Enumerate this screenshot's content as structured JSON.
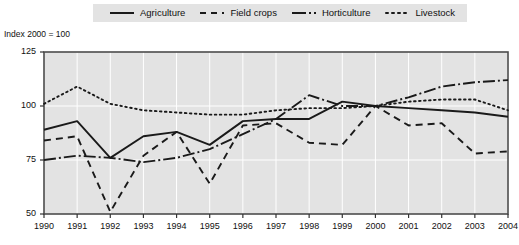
{
  "axis_note": "Index 2000 = 100",
  "legend": {
    "items": [
      {
        "label": "Agriculture",
        "key": "solid-line-key",
        "style": "solid"
      },
      {
        "label": "Field crops",
        "key": "dashed-line-key",
        "style": "dashed"
      },
      {
        "label": "Horticulture",
        "key": "dash-dot-line-key",
        "style": "dashdot"
      },
      {
        "label": "Livestock",
        "key": "dotted-line-key",
        "style": "dotted"
      }
    ]
  },
  "colors": {
    "line": "#1a1a1a",
    "plot_background": "#e3e3e3",
    "gridline": "#ffffff",
    "frame": "#4d4d4d",
    "legend_background": "#e3e3e3",
    "page_background": "#ffffff"
  },
  "chart_data": {
    "type": "line",
    "title": "",
    "subtitle": "",
    "xlabel": "",
    "ylabel": "Index 2000 = 100",
    "x": [
      1990,
      1991,
      1992,
      1993,
      1994,
      1995,
      1996,
      1997,
      1998,
      1999,
      2000,
      2001,
      2002,
      2003,
      2004
    ],
    "categories": [
      "1990",
      "1991",
      "1992",
      "1993",
      "1994",
      "1995",
      "1996",
      "1997",
      "1998",
      "1999",
      "2000",
      "2001",
      "2002",
      "2003",
      "2004"
    ],
    "xlim": [
      1990,
      2004
    ],
    "ylim": [
      50,
      125
    ],
    "yticks": [
      50,
      75,
      100,
      125
    ],
    "xticks": [
      "1990",
      "1991",
      "1992",
      "1993",
      "1994",
      "1995",
      "1996",
      "1997",
      "1998",
      "1999",
      "2000",
      "2001",
      "2002",
      "2003",
      "2004"
    ],
    "grid": true,
    "legend_position": "top",
    "series": [
      {
        "name": "Agriculture",
        "style": "solid",
        "values": [
          89,
          93,
          76,
          86,
          88,
          82,
          93,
          94,
          94,
          102,
          100,
          99,
          98,
          97,
          95
        ]
      },
      {
        "name": "Field crops",
        "style": "dashed",
        "values": [
          84,
          86,
          51,
          77,
          88,
          64,
          91,
          92,
          83,
          82,
          100,
          91,
          92,
          78,
          79
        ]
      },
      {
        "name": "Horticulture",
        "style": "dashdot",
        "values": [
          75,
          77,
          76,
          74,
          76,
          80,
          87,
          94,
          105,
          100,
          100,
          104,
          109,
          111,
          112
        ]
      },
      {
        "name": "Livestock",
        "style": "dotted",
        "values": [
          101,
          109,
          101,
          98,
          97,
          96,
          96,
          98,
          99,
          99,
          100,
          102,
          103,
          103,
          98
        ]
      }
    ]
  }
}
